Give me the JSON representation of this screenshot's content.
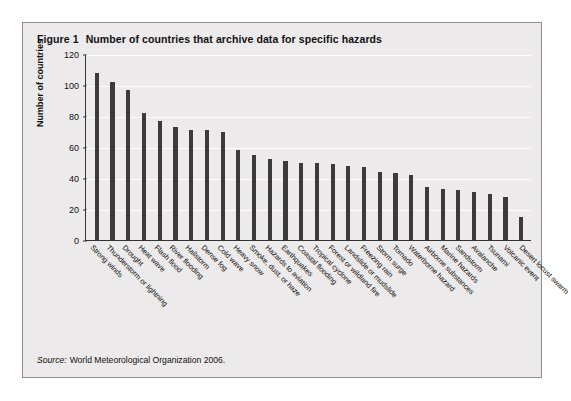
{
  "figure": {
    "number": "Figure 1",
    "title": "Number of countries that archive data for specific hazards",
    "source_label": "Source:",
    "source_text": "World Meteorological Organization 2006."
  },
  "chart_data": {
    "type": "bar",
    "title": "Number of countries that archive data for specific hazards",
    "xlabel": "",
    "ylabel": "Number of countries",
    "ylim": [
      0,
      120
    ],
    "yticks": [
      0,
      20,
      40,
      60,
      80,
      100,
      120
    ],
    "grid": true,
    "legend": "none",
    "bar_color": "#3b3b3b",
    "categories": [
      "Strong winds",
      "Thunderstorm or lightning",
      "Drought",
      "Heat wave",
      "Flash flood",
      "River flooding",
      "Hailstorm",
      "Dense fog",
      "Cold wave",
      "Heavy snow",
      "Smoke, dust, or haze",
      "Hazards to aviation",
      "Earthquakes",
      "Coastal flooding",
      "Tropical cyclone",
      "Forest or wildland fire",
      "Landslide or mudslide",
      "Freezing rain",
      "Storm surge",
      "Tornado",
      "Waterborne hazard",
      "Airborne substances",
      "Marine hazards",
      "Sandstorm",
      "Avalanche",
      "Tsunami",
      "Volcanic event",
      "Desert locust swarm"
    ],
    "values": [
      108,
      102,
      97,
      82,
      77,
      73,
      71,
      71,
      70,
      58,
      55,
      52,
      51,
      50,
      50,
      49,
      48,
      47,
      44,
      43,
      42,
      34,
      33,
      32,
      31,
      30,
      28,
      15
    ]
  }
}
